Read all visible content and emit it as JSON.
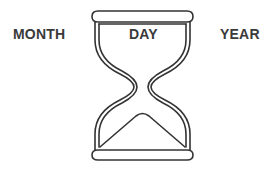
{
  "labels": {
    "month": "MONTH",
    "day": "DAY",
    "year": "YEAR"
  },
  "illustration": {
    "icon": "hourglass-icon",
    "stroke_color": "#333333",
    "text_color": "#3a3a3a",
    "background": "#ffffff"
  }
}
